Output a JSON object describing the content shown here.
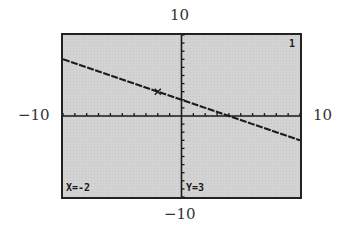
{
  "axis_labels": {
    "ymax": "10",
    "ymin": "−10",
    "xmin": "−10",
    "xmax": "10"
  },
  "screen": {
    "plot_indicator": "1",
    "trace_x": "X=-2",
    "trace_y": "Y=3",
    "background_color": "#d3d3d3",
    "ink_color": "#1a1a1a"
  },
  "chart_data": {
    "type": "line",
    "title": "",
    "xlabel": "",
    "ylabel": "",
    "xlim": [
      -10,
      10
    ],
    "ylim": [
      -10,
      10
    ],
    "xscale": 1,
    "yscale": 1,
    "grid": false,
    "series": [
      {
        "name": "Y1",
        "equation": "y = -x/2 + 2",
        "x": [
          -10,
          -8,
          -6,
          -4,
          -2,
          0,
          2,
          4,
          6,
          8,
          10
        ],
        "y": [
          7,
          6,
          5,
          4,
          3,
          2,
          1,
          0,
          -1,
          -2,
          -3
        ]
      }
    ],
    "trace_cursor": {
      "x": -2,
      "y": 3
    },
    "annotations": [
      "X=-2",
      "Y=3",
      "1"
    ]
  }
}
